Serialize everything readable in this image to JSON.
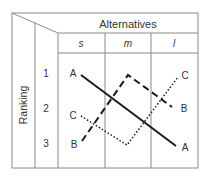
{
  "header": {
    "title": "Alternatives",
    "columns": [
      "s",
      "m",
      "l"
    ]
  },
  "row_header": {
    "title": "Ranking",
    "ranks": [
      "1",
      "2",
      "3"
    ]
  },
  "series": [
    {
      "name": "A",
      "style": "solid",
      "ranks": {
        "s": 1,
        "m": 2,
        "l": 3
      }
    },
    {
      "name": "B",
      "style": "dashed",
      "ranks": {
        "s": 3,
        "m": 1,
        "l": 2
      }
    },
    {
      "name": "C",
      "style": "dotted",
      "ranks": {
        "s": 2,
        "m": 3,
        "l": 1
      }
    }
  ],
  "labels": {
    "left": {
      "rank1": "A",
      "rank2": "C",
      "rank3": "B"
    },
    "right": {
      "rank1": "C",
      "rank2": "B",
      "rank3": "A"
    }
  },
  "colors": {
    "grid": "#8a8a8a",
    "line": "#1a1a1a",
    "text": "#333333"
  }
}
